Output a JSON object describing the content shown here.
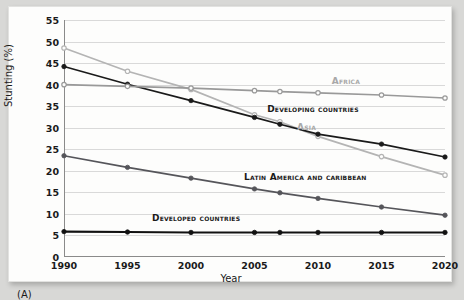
{
  "panel": {
    "letter": "(A)"
  },
  "chart_data": {
    "type": "line",
    "title": "",
    "xlabel": "Year",
    "ylabel": "Stunting (%)",
    "x": [
      1990,
      1995,
      2000,
      2005,
      2007,
      2010,
      2015,
      2020
    ],
    "xticks": [
      "1990",
      "1995",
      "2000",
      "2005",
      "2010",
      "2015",
      "2020"
    ],
    "xtick_values": [
      1990,
      1995,
      2000,
      2005,
      2010,
      2015,
      2020
    ],
    "yticks": [
      "0",
      "5",
      "10",
      "15",
      "20",
      "25",
      "30",
      "35",
      "40",
      "45",
      "50",
      "55"
    ],
    "ytick_values": [
      0,
      5,
      10,
      15,
      20,
      25,
      30,
      35,
      40,
      45,
      50,
      55
    ],
    "xlim": [
      1990,
      2020
    ],
    "ylim": [
      0,
      55
    ],
    "grid": true,
    "legend": "inline-labels",
    "series": [
      {
        "name": "Asia",
        "label": "Asia",
        "color": "#b4b4b4",
        "marker": "open-circle",
        "label_x": 2009.1,
        "label_y": 30.2,
        "points": [
          {
            "x": 1990,
            "y": 48.5
          },
          {
            "x": 1995,
            "y": 43.1
          },
          {
            "x": 2000,
            "y": 38.9
          },
          {
            "x": 2005,
            "y": 33.0
          },
          {
            "x": 2007,
            "y": 31.4
          },
          {
            "x": 2010,
            "y": 28.0
          },
          {
            "x": 2015,
            "y": 23.3
          },
          {
            "x": 2020,
            "y": 19.0
          }
        ]
      },
      {
        "name": "Developing countries",
        "label": "Developing countries",
        "color": "#1a1a1a",
        "marker": "filled-circle",
        "label_x": 2009.6,
        "label_y": 34.3,
        "points": [
          {
            "x": 1990,
            "y": 44.2
          },
          {
            "x": 1995,
            "y": 40.1
          },
          {
            "x": 2000,
            "y": 36.3
          },
          {
            "x": 2005,
            "y": 32.4
          },
          {
            "x": 2007,
            "y": 30.8
          },
          {
            "x": 2010,
            "y": 28.5
          },
          {
            "x": 2015,
            "y": 26.2
          },
          {
            "x": 2020,
            "y": 23.2
          }
        ]
      },
      {
        "name": "Africa",
        "label": "Africa",
        "color": "#999999",
        "marker": "open-circle",
        "label_x": 2012.2,
        "label_y": 40.8,
        "points": [
          {
            "x": 1990,
            "y": 40.0
          },
          {
            "x": 1995,
            "y": 39.6
          },
          {
            "x": 2000,
            "y": 39.2
          },
          {
            "x": 2005,
            "y": 38.6
          },
          {
            "x": 2007,
            "y": 38.4
          },
          {
            "x": 2010,
            "y": 38.1
          },
          {
            "x": 2015,
            "y": 37.6
          },
          {
            "x": 2020,
            "y": 36.9
          }
        ]
      },
      {
        "name": "Latin America and caribbean",
        "label": "Latin America and caribbean",
        "color": "#55555a",
        "marker": "filled-circle",
        "label_x": 2009.0,
        "label_y": 18.5,
        "points": [
          {
            "x": 1990,
            "y": 23.5
          },
          {
            "x": 1995,
            "y": 20.8
          },
          {
            "x": 2000,
            "y": 18.3
          },
          {
            "x": 2005,
            "y": 15.8
          },
          {
            "x": 2007,
            "y": 14.9
          },
          {
            "x": 2010,
            "y": 13.6
          },
          {
            "x": 2015,
            "y": 11.6
          },
          {
            "x": 2020,
            "y": 9.7
          }
        ]
      },
      {
        "name": "Developed countries",
        "label": "Developed countries",
        "color": "#111111",
        "marker": "filled-circle",
        "label_x": 2000.4,
        "label_y": 9.0,
        "points": [
          {
            "x": 1990,
            "y": 5.9
          },
          {
            "x": 1995,
            "y": 5.8
          },
          {
            "x": 2000,
            "y": 5.7
          },
          {
            "x": 2005,
            "y": 5.7
          },
          {
            "x": 2007,
            "y": 5.7
          },
          {
            "x": 2010,
            "y": 5.7
          },
          {
            "x": 2015,
            "y": 5.7
          },
          {
            "x": 2020,
            "y": 5.7
          }
        ]
      }
    ]
  }
}
